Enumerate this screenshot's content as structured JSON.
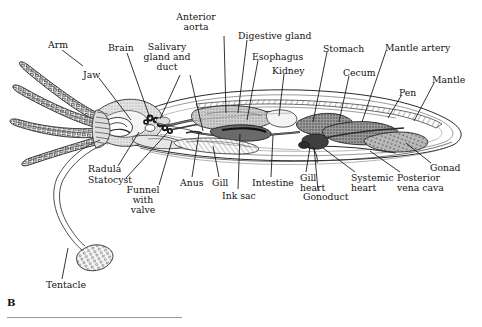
{
  "figure": {
    "letter": "B",
    "caption_rule": true,
    "background": "#ffffff",
    "ink": "#131313"
  },
  "labels": [
    {
      "id": "arm",
      "text": "Arm",
      "x": 48,
      "y": 40,
      "align": "left",
      "lines": [
        [
          62,
          50,
          83,
          66
        ]
      ]
    },
    {
      "id": "brain",
      "text": "Brain",
      "x": 108,
      "y": 43,
      "align": "left",
      "lines": [
        [
          127,
          53,
          150,
          118
        ]
      ]
    },
    {
      "id": "jaw",
      "text": "Jaw",
      "x": 83,
      "y": 70,
      "align": "left",
      "lines": [
        [
          99,
          78,
          131,
          120
        ]
      ]
    },
    {
      "id": "salivary-gland-and-duct",
      "text": "Salivary\ngland and\nduct",
      "x": 167,
      "y": 42,
      "align": "center",
      "lines": [
        [
          180,
          75,
          160,
          119
        ],
        [
          190,
          75,
          203,
          131
        ]
      ]
    },
    {
      "id": "anterior-aorta",
      "text": "Anterior\naorta",
      "x": 196,
      "y": 12,
      "align": "center",
      "lines": [
        [
          224,
          36,
          226,
          113
        ]
      ]
    },
    {
      "id": "digestive-gland",
      "text": "Digestive gland",
      "x": 238,
      "y": 31,
      "align": "left",
      "lines": [
        [
          247,
          40,
          238,
          113
        ]
      ]
    },
    {
      "id": "esophagus",
      "text": "Esophagus",
      "x": 252,
      "y": 52,
      "align": "left",
      "lines": [
        [
          258,
          60,
          247,
          120
        ]
      ]
    },
    {
      "id": "kidney",
      "text": "Kidney",
      "x": 272,
      "y": 66,
      "align": "left",
      "lines": [
        [
          284,
          74,
          279,
          116
        ]
      ]
    },
    {
      "id": "stomach",
      "text": "Stomach",
      "x": 323,
      "y": 44,
      "align": "left",
      "lines": [
        [
          327,
          52,
          313,
          122
        ]
      ]
    },
    {
      "id": "cecum",
      "text": "Cecum",
      "x": 343,
      "y": 68,
      "align": "left",
      "lines": [
        [
          349,
          76,
          339,
          122
        ]
      ]
    },
    {
      "id": "mantle-artery",
      "text": "Mantle artery",
      "x": 385,
      "y": 43,
      "align": "left",
      "lines": [
        [
          386,
          51,
          362,
          122
        ]
      ]
    },
    {
      "id": "pen",
      "text": "Pen",
      "x": 399,
      "y": 88,
      "align": "left",
      "lines": [
        [
          401,
          96,
          388,
          118
        ]
      ]
    },
    {
      "id": "mantle",
      "text": "Mantle",
      "x": 432,
      "y": 75,
      "align": "left",
      "lines": [
        [
          434,
          83,
          414,
          121
        ]
      ]
    },
    {
      "id": "gonad",
      "text": "Gonad",
      "x": 430,
      "y": 163,
      "align": "left",
      "lines": [
        [
          431,
          163,
          406,
          143
        ]
      ]
    },
    {
      "id": "posterior-vena-cava",
      "text": "Posterior\nvena cava",
      "x": 397,
      "y": 173,
      "align": "left",
      "lines": [
        [
          400,
          172,
          370,
          151
        ]
      ]
    },
    {
      "id": "systemic-heart",
      "text": "Systemic\nheart",
      "x": 351,
      "y": 173,
      "align": "left",
      "lines": [
        [
          355,
          172,
          323,
          148
        ]
      ]
    },
    {
      "id": "gonoduct",
      "text": "Gonoduct",
      "x": 303,
      "y": 192,
      "align": "left",
      "lines": [
        [
          318,
          190,
          314,
          147
        ]
      ]
    },
    {
      "id": "gill-heart",
      "text": "Gill\nheart",
      "x": 300,
      "y": 173,
      "align": "left",
      "lines": [
        [
          306,
          172,
          310,
          147
        ]
      ]
    },
    {
      "id": "intestine",
      "text": "Intestine",
      "x": 252,
      "y": 178,
      "align": "left",
      "lines": [
        [
          271,
          177,
          273,
          135
        ]
      ]
    },
    {
      "id": "ink-sac",
      "text": "Ink sac",
      "x": 222,
      "y": 191,
      "align": "left",
      "lines": [
        [
          238,
          189,
          240,
          134
        ]
      ]
    },
    {
      "id": "gill",
      "text": "Gill",
      "x": 212,
      "y": 178,
      "align": "left",
      "lines": [
        [
          219,
          177,
          213,
          146
        ]
      ]
    },
    {
      "id": "anus",
      "text": "Anus",
      "x": 180,
      "y": 178,
      "align": "left",
      "lines": [
        [
          192,
          177,
          199,
          133
        ]
      ]
    },
    {
      "id": "funnel-with-valve",
      "text": "Funnel\nwith\nvalve",
      "x": 143,
      "y": 185,
      "align": "center",
      "lines": [
        [
          159,
          185,
          172,
          141
        ]
      ]
    },
    {
      "id": "statocyst",
      "text": "Statocyst",
      "x": 88,
      "y": 175,
      "align": "left",
      "lines": [
        [
          126,
          178,
          168,
          132
        ]
      ]
    },
    {
      "id": "radula",
      "text": "Radula",
      "x": 88,
      "y": 164,
      "align": "left",
      "lines": [
        [
          118,
          166,
          139,
          132
        ]
      ]
    },
    {
      "id": "tentacle",
      "text": "Tentacle",
      "x": 46,
      "y": 280,
      "align": "left",
      "lines": [
        [
          62,
          279,
          68,
          248
        ]
      ]
    }
  ]
}
